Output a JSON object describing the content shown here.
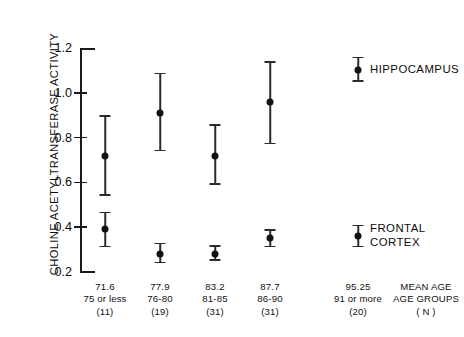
{
  "chart_data": {
    "type": "scatter",
    "title": "",
    "xlabel": "",
    "ylabel": "CHOLINE ACETYLTRANSFERASE ACTIVITY",
    "ylim": [
      0.2,
      1.2
    ],
    "yticks": [
      "0.2",
      "0.4",
      "0.6",
      "0.8",
      "1.0",
      "1.2"
    ],
    "ytick_values": [
      0.2,
      0.4,
      0.6,
      0.8,
      1.0,
      1.2
    ],
    "grid": false,
    "legend_position": "right",
    "categories": [
      "75 or less",
      "76-80",
      "81-85",
      "86-90",
      "91 or more"
    ],
    "mean_ages": [
      "71.6",
      "77.9",
      "83.2",
      "87.7",
      "95.25"
    ],
    "counts": [
      "(11)",
      "(19)",
      "(31)",
      "(31)",
      "(20)"
    ],
    "series": [
      {
        "name": "HIPPOCAMPUS",
        "values": [
          0.72,
          0.91,
          0.72,
          0.96,
          1.1
        ],
        "err_low": [
          0.54,
          0.74,
          0.59,
          0.77,
          1.05
        ],
        "err_high": [
          0.9,
          1.09,
          0.86,
          1.14,
          1.16
        ]
      },
      {
        "name": "FRONTAL CORTEX",
        "values": [
          0.39,
          0.28,
          0.28,
          0.35,
          0.36
        ],
        "err_low": [
          0.31,
          0.24,
          0.25,
          0.31,
          0.31
        ],
        "err_high": [
          0.47,
          0.33,
          0.32,
          0.39,
          0.41
        ]
      }
    ],
    "axis_footer": {
      "line1": "MEAN AGE",
      "line2": "AGE GROUPS",
      "line3": "( N )"
    }
  },
  "legend": {
    "hippocampus": "HIPPOCAMPUS",
    "frontal_cortex_line1": "FRONTAL",
    "frontal_cortex_line2": "CORTEX"
  },
  "colors": {
    "marker": "#111111",
    "axis": "#1a1a1a",
    "background": "#ffffff"
  }
}
